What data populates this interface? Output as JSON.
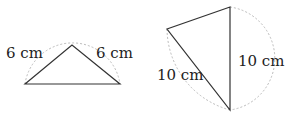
{
  "figures": [
    {
      "name": "isosceles-triangle-left",
      "side_labels": [
        "6 cm",
        "6 cm"
      ]
    },
    {
      "name": "isosceles-triangle-right",
      "side_labels": [
        "10 cm",
        "10 cm"
      ]
    }
  ],
  "colors": {
    "stroke": "#333333",
    "arc": "#bbbbbb"
  }
}
